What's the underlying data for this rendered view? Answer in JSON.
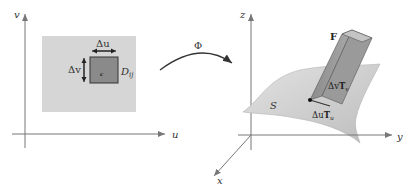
{
  "left_panel": {
    "axis_u_label": "u",
    "axis_v_label": "v",
    "region_label": "D",
    "region_subscript": "ij",
    "delta_u_label": "Δu",
    "delta_v_label": "Δv",
    "point_label": "c"
  },
  "mapping": {
    "label": "Φ"
  },
  "right_panel": {
    "axis_x_label": "x",
    "axis_y_label": "y",
    "axis_z_label": "z",
    "surface_label": "S",
    "force_label": "F",
    "tangent_v_label": "Δv",
    "tangent_v_vec": "T",
    "tangent_v_sub": "v",
    "tangent_u_label": "Δu",
    "tangent_u_vec": "T",
    "tangent_u_sub": "u"
  },
  "colors": {
    "region_fill": "#d6d6d6",
    "cell_fill": "#8a8a8a",
    "surface_fill": "#cfcfcf",
    "axis": "#777777"
  }
}
